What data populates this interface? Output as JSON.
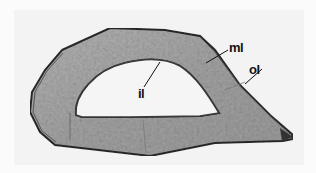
{
  "figure": {
    "colors": {
      "background": "#f3f3f3",
      "wall_fill": "#a9a9a9",
      "wall_edge": "#2a2a2a",
      "lumen": "#f5f5f5",
      "label": "#111111"
    },
    "labels": [
      {
        "id": "ml",
        "text": "ml",
        "meaning_position": "middle layer"
      },
      {
        "id": "ol",
        "text": "ol",
        "meaning_position": "outer layer"
      },
      {
        "id": "il",
        "text": "il",
        "meaning_position": "inner layer"
      }
    ]
  }
}
